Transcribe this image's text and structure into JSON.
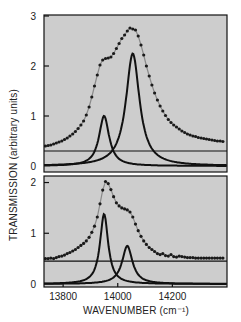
{
  "chart_data": {
    "type": "line",
    "title": "",
    "xlabel": "WAVENUMBER (cm⁻¹)",
    "ylabel": "TRANSMISSION (arbitrary units)",
    "xlim": [
      13730,
      14400
    ],
    "x_ticks": [
      13800,
      14000,
      14200
    ],
    "x_tick_labels": [
      "13800",
      "14000",
      "14200"
    ],
    "grid": false,
    "legend": null,
    "panels": [
      {
        "name": "top",
        "ylim": [
          0,
          3
        ],
        "y_ticks": [
          0,
          1,
          2,
          3
        ],
        "y_tick_labels": [
          "0",
          "1",
          "2",
          "3"
        ],
        "baseline": 0.3,
        "components": [
          {
            "name": "peak-1",
            "center": 13950,
            "width": 45,
            "amplitude": 1.0
          },
          {
            "name": "peak-2",
            "center": 14055,
            "width": 60,
            "amplitude": 2.25
          }
        ],
        "data_points": {
          "x": [
            13735,
            13745,
            13755,
            13765,
            13775,
            13785,
            13795,
            13805,
            13815,
            13825,
            13835,
            13845,
            13855,
            13865,
            13875,
            13885,
            13895,
            13905,
            13915,
            13925,
            13935,
            13945,
            13955,
            13965,
            13975,
            13985,
            13995,
            14005,
            14015,
            14025,
            14035,
            14045,
            14055,
            14065,
            14075,
            14085,
            14095,
            14105,
            14115,
            14125,
            14135,
            14145,
            14155,
            14165,
            14175,
            14185,
            14195,
            14205,
            14215,
            14225,
            14235,
            14245,
            14255,
            14265,
            14275,
            14285,
            14295,
            14305,
            14315,
            14325,
            14335,
            14345,
            14355,
            14365,
            14375,
            14385
          ],
          "y": [
            0.4,
            0.41,
            0.42,
            0.44,
            0.46,
            0.48,
            0.5,
            0.53,
            0.56,
            0.6,
            0.64,
            0.69,
            0.75,
            0.82,
            0.9,
            1.02,
            1.18,
            1.38,
            1.6,
            1.82,
            2.02,
            2.12,
            2.15,
            2.16,
            2.18,
            2.25,
            2.35,
            2.45,
            2.55,
            2.62,
            2.7,
            2.76,
            2.74,
            2.72,
            2.6,
            2.42,
            2.22,
            2.0,
            1.8,
            1.62,
            1.46,
            1.32,
            1.2,
            1.1,
            1.01,
            0.93,
            0.87,
            0.82,
            0.78,
            0.74,
            0.7,
            0.67,
            0.64,
            0.62,
            0.6,
            0.59,
            0.57,
            0.56,
            0.55,
            0.54,
            0.53,
            0.52,
            0.51,
            0.5,
            0.5,
            0.49
          ]
        }
      },
      {
        "name": "bottom",
        "ylim": [
          0,
          2.05
        ],
        "y_ticks": [
          0,
          1,
          2
        ],
        "y_tick_labels": [
          "0",
          "1",
          "2"
        ],
        "baseline": 0.45,
        "components": [
          {
            "name": "peak-1",
            "center": 13950,
            "width": 36,
            "amplitude": 1.38
          },
          {
            "name": "peak-2",
            "center": 14035,
            "width": 46,
            "amplitude": 0.75
          }
        ],
        "data_points": {
          "x": [
            13735,
            13745,
            13755,
            13765,
            13775,
            13785,
            13795,
            13805,
            13815,
            13825,
            13835,
            13845,
            13855,
            13865,
            13875,
            13885,
            13895,
            13905,
            13915,
            13925,
            13935,
            13945,
            13955,
            13965,
            13975,
            13985,
            13995,
            14005,
            14015,
            14025,
            14035,
            14045,
            14055,
            14065,
            14075,
            14085,
            14095,
            14105,
            14115,
            14125,
            14135,
            14145,
            14155,
            14165,
            14175,
            14185,
            14195,
            14205,
            14215,
            14225,
            14235,
            14245,
            14255,
            14265,
            14275,
            14285,
            14295,
            14305,
            14315,
            14325,
            14335,
            14345,
            14355,
            14365,
            14375,
            14385
          ],
          "y": [
            0.5,
            0.5,
            0.51,
            0.5,
            0.52,
            0.54,
            0.55,
            0.57,
            0.6,
            0.62,
            0.65,
            0.68,
            0.72,
            0.76,
            0.8,
            0.85,
            0.92,
            1.02,
            1.14,
            1.32,
            1.58,
            1.85,
            2.02,
            1.98,
            1.86,
            1.72,
            1.6,
            1.54,
            1.5,
            1.48,
            1.46,
            1.42,
            1.32,
            1.18,
            1.05,
            0.94,
            0.85,
            0.78,
            0.72,
            0.68,
            0.64,
            0.6,
            0.58,
            0.6,
            0.56,
            0.55,
            0.58,
            0.54,
            0.53,
            0.55,
            0.54,
            0.53,
            0.52,
            0.52,
            0.52,
            0.51,
            0.51,
            0.51,
            0.51,
            0.51,
            0.51,
            0.51,
            0.51,
            0.51,
            0.51,
            0.51
          ]
        }
      }
    ]
  },
  "style": {
    "plot_background": "#cdcdcd",
    "frame_color": "#111111",
    "curve_color": "#111111",
    "point_color": "#1a1a1a",
    "fit_color": "#8a8a8a",
    "page_background": "#ffffff"
  },
  "layout": {
    "plot_left": 44,
    "plot_right": 227,
    "panels_px": [
      {
        "top": 15,
        "bottom": 172,
        "y0_px": 166,
        "y_at_max_px": 16
      },
      {
        "top": 176,
        "bottom": 287,
        "y0_px": 284,
        "y_at_max_px": 180
      }
    ]
  }
}
